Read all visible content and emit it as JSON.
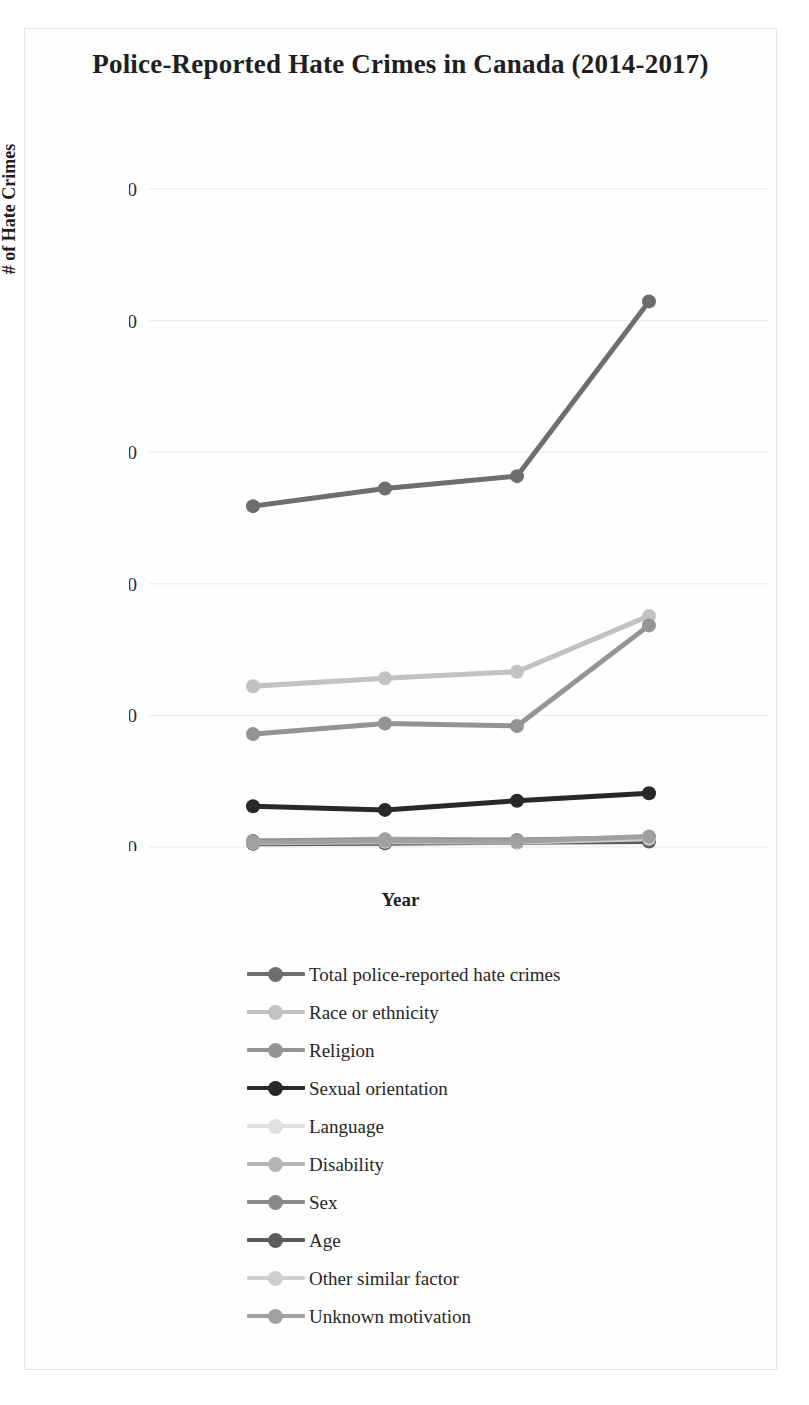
{
  "figure": {
    "title": "Police-Reported Hate Crimes in Canada (2014-2017)"
  },
  "axes": {
    "x_title": "Year",
    "y_title": "# of Hate Crimes",
    "x_tick_labels": [
      "2014",
      "2015",
      "2016",
      "2017"
    ],
    "y_tick_labels": [
      "0",
      "500",
      "1,000",
      "1,500",
      "2,000",
      "2,500"
    ]
  },
  "chart_data": {
    "type": "line",
    "title": "Police-Reported Hate Crimes in Canada (2014-2017)",
    "xlabel": "Year",
    "ylabel": "# of Hate Crimes",
    "categories": [
      "2014",
      "2015",
      "2016",
      "2017"
    ],
    "x": [
      2014,
      2015,
      2016,
      2017
    ],
    "ylim": [
      0,
      2500
    ],
    "yticks": [
      0,
      500,
      1000,
      1500,
      2000,
      2500
    ],
    "grid": "horizontal",
    "legend_position": "bottom",
    "series": [
      {
        "name": "Total police-reported hate crimes",
        "values": [
          1295,
          1362,
          1409,
          2073
        ],
        "color": "#6e6e6e"
      },
      {
        "name": "Race or ethnicity",
        "values": [
          611,
          641,
          666,
          878
        ],
        "color": "#c2c2c2"
      },
      {
        "name": "Religion",
        "values": [
          429,
          469,
          460,
          842
        ],
        "color": "#949494"
      },
      {
        "name": "Sexual orientation",
        "values": [
          155,
          141,
          176,
          204
        ],
        "color": "#282828"
      },
      {
        "name": "Language",
        "values": [
          19,
          23,
          16,
          37
        ],
        "color": "#e0e0e0"
      },
      {
        "name": "Disability",
        "values": [
          22,
          30,
          25,
          36
        ],
        "color": "#b5b5b5"
      },
      {
        "name": "Sex",
        "values": [
          23,
          26,
          27,
          35
        ],
        "color": "#8a8a8a"
      },
      {
        "name": "Age",
        "values": [
          12,
          14,
          18,
          21
        ],
        "color": "#5c5c5c"
      },
      {
        "name": "Other similar factor",
        "values": [
          16,
          20,
          19,
          31
        ],
        "color": "#cfcfcf"
      },
      {
        "name": "Unknown motivation",
        "values": [
          18,
          24,
          22,
          40
        ],
        "color": "#a0a0a0"
      }
    ]
  },
  "legend": {
    "items": [
      {
        "label": "Total police-reported hate crimes",
        "color": "#6e6e6e"
      },
      {
        "label": "Race or ethnicity",
        "color": "#c2c2c2"
      },
      {
        "label": "Religion",
        "color": "#949494"
      },
      {
        "label": "Sexual orientation",
        "color": "#282828"
      },
      {
        "label": "Language",
        "color": "#e0e0e0"
      },
      {
        "label": "Disability",
        "color": "#b5b5b5"
      },
      {
        "label": "Sex",
        "color": "#8a8a8a"
      },
      {
        "label": "Age",
        "color": "#5c5c5c"
      },
      {
        "label": "Other similar factor",
        "color": "#cfcfcf"
      },
      {
        "label": "Unknown motivation",
        "color": "#a0a0a0"
      }
    ]
  }
}
